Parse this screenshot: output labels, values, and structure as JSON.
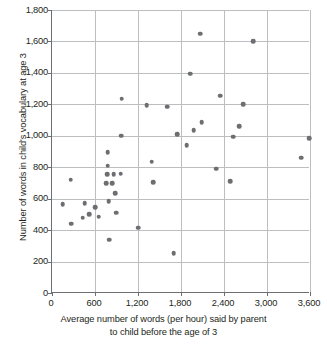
{
  "chart_data": {
    "type": "scatter",
    "title": "",
    "xlabel": "Average number of words (per hour) said by parent to child before the age of 3",
    "xlabel_lines": [
      "Average number of words (per hour) said by parent",
      "to child before the age of 3"
    ],
    "ylabel": "Number of words in child's vocabulary at age 3",
    "xlim": [
      0,
      3600
    ],
    "ylim": [
      0,
      1800
    ],
    "xticks": [
      0,
      600,
      1200,
      1800,
      2400,
      3000,
      3600
    ],
    "xtick_labels": [
      "0",
      "600",
      "1,200",
      "1,800",
      "2,400",
      "3,000",
      "3,600"
    ],
    "yticks": [
      0,
      200,
      400,
      600,
      800,
      1000,
      1200,
      1400,
      1600,
      1800
    ],
    "ytick_labels": [
      "0",
      "200",
      "400",
      "600",
      "800",
      "1,000",
      "1,200",
      "1,400",
      "1,600",
      "1,800"
    ],
    "grid": true,
    "grid_color": "#bcbec0",
    "axis_color": "#6d6e71",
    "marker_color": "#6d6e71",
    "marker_size": 4.6,
    "legend": null,
    "series_name": "parent words vs child vocabulary",
    "points": [
      [
        150,
        565
      ],
      [
        260,
        720
      ],
      [
        265,
        440
      ],
      [
        430,
        480
      ],
      [
        455,
        570
      ],
      [
        520,
        500
      ],
      [
        600,
        545
      ],
      [
        650,
        485
      ],
      [
        760,
        700
      ],
      [
        770,
        755
      ],
      [
        775,
        810
      ],
      [
        780,
        895
      ],
      [
        790,
        585
      ],
      [
        800,
        340
      ],
      [
        840,
        700
      ],
      [
        860,
        755
      ],
      [
        880,
        635
      ],
      [
        895,
        510
      ],
      [
        960,
        760
      ],
      [
        965,
        1000
      ],
      [
        975,
        1235
      ],
      [
        1200,
        415
      ],
      [
        1320,
        1195
      ],
      [
        1390,
        835
      ],
      [
        1410,
        705
      ],
      [
        1610,
        1185
      ],
      [
        1700,
        255
      ],
      [
        1745,
        1010
      ],
      [
        1880,
        940
      ],
      [
        1925,
        1395
      ],
      [
        1980,
        1035
      ],
      [
        2070,
        1650
      ],
      [
        2090,
        1085
      ],
      [
        2290,
        790
      ],
      [
        2350,
        1255
      ],
      [
        2490,
        710
      ],
      [
        2530,
        995
      ],
      [
        2610,
        1060
      ],
      [
        2670,
        1200
      ],
      [
        2810,
        1600
      ],
      [
        3480,
        860
      ],
      [
        3590,
        985
      ]
    ]
  }
}
